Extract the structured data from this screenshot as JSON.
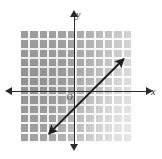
{
  "figure": {
    "top_caption": "· · ·  ·· ·  ··",
    "origin_label": "O",
    "x_axis_label": "x",
    "y_axis_label": "y"
  },
  "colors": {
    "grid_fill_dark": "#9d9d9d",
    "grid_fill_light": "#e0e0e0",
    "gridline": "#ffffff",
    "axis": "#2a2a2a",
    "line": "#1e1e1e",
    "page_background": "#ffffff"
  },
  "chart_data": {
    "type": "line",
    "title": "",
    "subtitle": "",
    "xlabel": "x",
    "ylabel": "y",
    "xlim": [
      -7,
      5
    ],
    "ylim": [
      -6,
      6
    ],
    "grid": true,
    "grid_spacing": 1,
    "grid_columns": 12,
    "grid_rows": 12,
    "legend": "none",
    "axis_arrows": [
      "left",
      "right",
      "up",
      "down"
    ],
    "origin_marker": "O",
    "tick_labels_x": [],
    "tick_labels_y": [],
    "series": [
      {
        "name": "line",
        "equation": "y = x - 1",
        "slope": 1,
        "y_intercept": -1,
        "x_intercept": 1,
        "style": "solid double-headed arrow",
        "x": [
          -4,
          4
        ],
        "values": [
          -5,
          3
        ],
        "marked_points": [
          {
            "x": 0,
            "y": -1
          },
          {
            "x": 1,
            "y": 0
          },
          {
            "x": 3,
            "y": 2
          }
        ],
        "endpoints": [
          {
            "x": -4,
            "y": -5,
            "arrow": true
          },
          {
            "x": 4,
            "y": 3,
            "arrow": true
          }
        ]
      }
    ]
  }
}
